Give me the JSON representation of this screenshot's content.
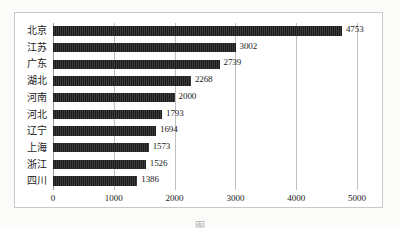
{
  "figure": {
    "caption_clipped": "图",
    "caption_note": "caption row clipped at image bottom edge"
  },
  "chart_data": {
    "type": "bar",
    "orientation": "horizontal",
    "title": "",
    "xlabel": "",
    "ylabel": "",
    "categories": [
      "北京",
      "江苏",
      "广东",
      "湖北",
      "河南",
      "河北",
      "辽宁",
      "上海",
      "浙江",
      "四川"
    ],
    "values": [
      4753,
      3002,
      2739,
      2268,
      2000,
      1793,
      1694,
      1573,
      1526,
      1386
    ],
    "value_labels": [
      "4753",
      "3002",
      "2739",
      "2268",
      "2000",
      "1793",
      "1694",
      "1573",
      "1526",
      "1386"
    ],
    "xlim": [
      0,
      5000
    ],
    "xticks": [
      0,
      1000,
      2000,
      3000,
      4000,
      5000
    ],
    "xtick_labels": [
      "0",
      "1000",
      "2000",
      "3000",
      "4000",
      "5000"
    ],
    "grid": "vertical",
    "legend": "none",
    "bar_color": "#222222",
    "grid_color": "#c0c0c0",
    "frame_color": "#c8c8c8"
  }
}
